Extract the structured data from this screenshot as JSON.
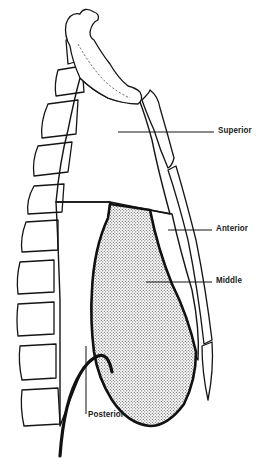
{
  "figure": {
    "background": "#ffffff",
    "ink_color": "#151515"
  },
  "labels": {
    "superior": "Superior",
    "anterior": "Anterior",
    "middle": "Middle",
    "posterior": "Posterior"
  },
  "regions": [
    {
      "name": "superior",
      "pattern": "diagonal-hatch"
    },
    {
      "name": "anterior",
      "pattern": "fine-diagonal-hatch"
    },
    {
      "name": "middle",
      "pattern": "stipple-dots"
    },
    {
      "name": "posterior",
      "pattern": "vertical-lines"
    }
  ],
  "structures": {
    "left": "vertebral-column",
    "right": "sternum",
    "top": "first-rib-clavicle",
    "bottom": "diaphragm"
  }
}
